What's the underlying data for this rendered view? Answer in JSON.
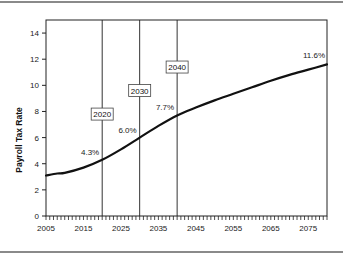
{
  "chart_data": {
    "type": "line",
    "title": "",
    "xlabel": "",
    "ylabel": "Payroll Tax Rate",
    "xlim": [
      2005,
      2080
    ],
    "ylim": [
      0,
      15
    ],
    "x_ticks": [
      2005,
      2015,
      2025,
      2035,
      2045,
      2055,
      2065,
      2075
    ],
    "y_ticks": [
      0,
      2,
      4,
      6,
      8,
      10,
      12,
      14
    ],
    "grid": false,
    "legend": null,
    "series": [
      {
        "name": "Payroll Tax Rate",
        "x": [
          2005,
          2008,
          2010,
          2015,
          2020,
          2025,
          2030,
          2035,
          2040,
          2045,
          2050,
          2055,
          2060,
          2065,
          2070,
          2075,
          2080
        ],
        "values": [
          3.1,
          3.25,
          3.3,
          3.7,
          4.3,
          5.1,
          6.0,
          6.9,
          7.7,
          8.3,
          8.85,
          9.35,
          9.85,
          10.35,
          10.8,
          11.2,
          11.6
        ]
      }
    ],
    "vertical_markers": [
      {
        "x": 2020,
        "label": "2020",
        "label_y": 7.8
      },
      {
        "x": 2030,
        "label": "2030",
        "label_y": 9.6
      },
      {
        "x": 2040,
        "label": "2040",
        "label_y": 11.4
      }
    ],
    "annotations": [
      {
        "x": 2020,
        "y": 4.3,
        "text": "4.3%"
      },
      {
        "x": 2030,
        "y": 6.0,
        "text": "6.0%"
      },
      {
        "x": 2040,
        "y": 7.7,
        "text": "7.7%"
      },
      {
        "x": 2080,
        "y": 11.6,
        "text": "11.6%"
      }
    ]
  }
}
